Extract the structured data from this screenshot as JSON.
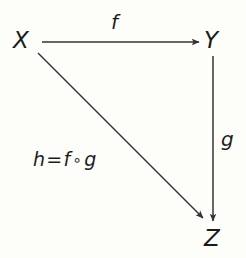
{
  "figure": {
    "kind": "commutative-diagram",
    "background_color": "#fdfdfa",
    "stroke_color": "#333333",
    "text_color": "#1a1a1a"
  },
  "nodes": {
    "x": {
      "label": "X"
    },
    "y": {
      "label": "Y"
    },
    "z": {
      "label": "Z"
    }
  },
  "arrows": {
    "f": {
      "label": "f",
      "from": "X",
      "to": "Y"
    },
    "g": {
      "label": "g",
      "from": "Y",
      "to": "Z"
    },
    "h": {
      "label": "h = f ∘ g",
      "lhs": "h",
      "equals": "=",
      "first": "f",
      "operator": "∘",
      "second": "g",
      "from": "X",
      "to": "Z"
    }
  }
}
